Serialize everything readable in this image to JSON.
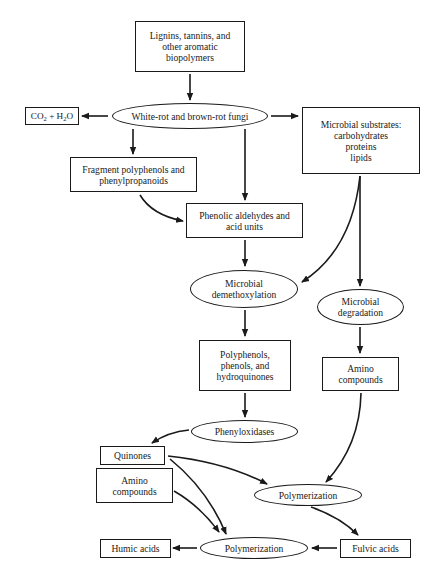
{
  "diagram": {
    "nodes": {
      "lignins": {
        "lines": [
          "Lignins, tannins, and",
          "other aromatic",
          "biopolymers"
        ],
        "shape": "box"
      },
      "co2_h2o": {
        "label": "CO2 + H2O",
        "parts": [
          "CO",
          "2",
          " + H",
          "2",
          "O"
        ],
        "shape": "box"
      },
      "fungi": {
        "label": "White-rot and brown-rot fungi",
        "shape": "ellipse"
      },
      "microbial_substrates": {
        "lines": [
          "Microbial substrates:",
          "carbohydrates",
          "proteins",
          "lipids"
        ],
        "shape": "box"
      },
      "fragment_polyphenols": {
        "lines": [
          "Fragment polyphenols and",
          "phenylpropanoids"
        ],
        "shape": "box"
      },
      "phenolic_aldehydes": {
        "lines": [
          "Phenolic aldehydes and",
          "acid units"
        ],
        "shape": "box"
      },
      "demethoxylation": {
        "lines": [
          "Microbial",
          "demethoxylation"
        ],
        "shape": "ellipse"
      },
      "degradation": {
        "lines": [
          "Microbial",
          "degradation"
        ],
        "shape": "ellipse"
      },
      "polyphenols": {
        "lines": [
          "Polyphenols,",
          "phenols, and",
          "hydroquinones"
        ],
        "shape": "box"
      },
      "amino_right": {
        "lines": [
          "Amino",
          "compounds"
        ],
        "shape": "box"
      },
      "phenyloxidases": {
        "label": "Phenyloxidases",
        "shape": "ellipse"
      },
      "quinones": {
        "label": "Quinones",
        "shape": "box"
      },
      "amino_left": {
        "lines": [
          "Amino",
          "compounds"
        ],
        "shape": "box"
      },
      "polymerization_upper": {
        "label": "Polymerization",
        "shape": "ellipse"
      },
      "polymerization_lower": {
        "label": "Polymerization",
        "shape": "ellipse"
      },
      "humic_acids": {
        "label": "Humic acids",
        "shape": "box"
      },
      "fulvic_acids": {
        "label": "Fulvic acids",
        "shape": "box"
      }
    },
    "edges": [
      [
        "lignins",
        "fungi"
      ],
      [
        "fungi",
        "co2_h2o"
      ],
      [
        "fungi",
        "microbial_substrates"
      ],
      [
        "fungi",
        "fragment_polyphenols"
      ],
      [
        "fungi",
        "phenolic_aldehydes"
      ],
      [
        "fragment_polyphenols",
        "phenolic_aldehydes"
      ],
      [
        "phenolic_aldehydes",
        "demethoxylation"
      ],
      [
        "microbial_substrates",
        "demethoxylation"
      ],
      [
        "microbial_substrates",
        "degradation"
      ],
      [
        "demethoxylation",
        "polyphenols"
      ],
      [
        "degradation",
        "amino_right"
      ],
      [
        "polyphenols",
        "phenyloxidases"
      ],
      [
        "phenyloxidases",
        "quinones"
      ],
      [
        "amino_right",
        "polymerization_upper"
      ],
      [
        "quinones",
        "polymerization_upper"
      ],
      [
        "quinones",
        "polymerization_lower"
      ],
      [
        "amino_left",
        "polymerization_lower"
      ],
      [
        "polymerization_upper",
        "fulvic_acids"
      ],
      [
        "fulvic_acids",
        "polymerization_lower"
      ],
      [
        "polymerization_lower",
        "humic_acids"
      ]
    ],
    "colors": {
      "stroke": "#1a1a1a",
      "background": "#ffffff"
    }
  }
}
